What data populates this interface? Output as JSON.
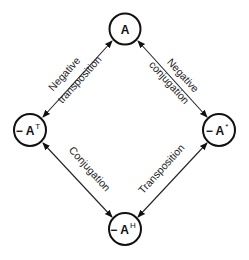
{
  "diagram": {
    "type": "relationship-diamond",
    "colors": {
      "stroke": "#111111",
      "background": "#ffffff",
      "text": "#222222"
    },
    "nodes": {
      "top": {
        "prefix": "",
        "base": "A",
        "sup": ""
      },
      "left": {
        "prefix": "− ",
        "base": "A",
        "sup": "T"
      },
      "right": {
        "prefix": "− ",
        "base": "A",
        "sup": "*"
      },
      "bottom": {
        "prefix": "− ",
        "base": "A",
        "sup": "H"
      }
    },
    "edges": {
      "top_left": {
        "from": "A",
        "to": "−Aᵀ",
        "line1": "Negative",
        "line2": "transposition",
        "arrow": "bidirectional"
      },
      "top_right": {
        "from": "A",
        "to": "−A*",
        "line1": "Negative",
        "line2": "conjugation",
        "arrow": "bidirectional"
      },
      "bottom_left": {
        "from": "−Aᵀ",
        "to": "−Aᴴ",
        "line1": "Conjugation",
        "arrow": "bidirectional"
      },
      "bottom_right": {
        "from": "−A*",
        "to": "−Aᴴ",
        "line1": "Transposition",
        "arrow": "bidirectional"
      }
    }
  }
}
